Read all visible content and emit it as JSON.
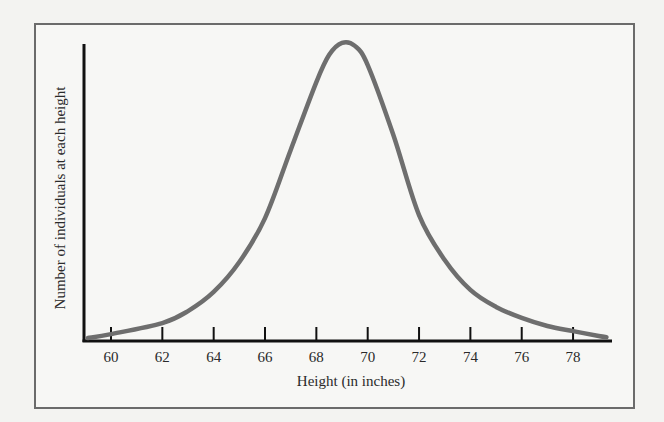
{
  "chart_data": {
    "type": "line",
    "title": "",
    "xlabel": "Height (in inches)",
    "ylabel": "Number of individuals at each height",
    "x_ticks": [
      60,
      62,
      64,
      66,
      68,
      70,
      72,
      74,
      76,
      78
    ],
    "xlim": [
      59,
      79.3
    ],
    "ylim": [
      0,
      100
    ],
    "y_ticks": [],
    "grid": false,
    "legend": null,
    "series": [
      {
        "name": "Height distribution",
        "color": "#6e6e6e",
        "x": [
          59.1,
          60,
          62,
          63,
          64,
          65,
          66,
          67,
          68,
          68.5,
          69,
          69.5,
          70,
          71,
          72,
          73,
          74,
          75,
          76,
          77,
          78,
          79,
          79.3
        ],
        "values": [
          1,
          2.3,
          6,
          10,
          16.4,
          26.4,
          41.1,
          63.9,
          86.6,
          95.7,
          99.7,
          98.7,
          92.3,
          68.9,
          42.1,
          27.1,
          17.1,
          11.4,
          7.7,
          5,
          3.3,
          1.7,
          1.3
        ]
      }
    ],
    "peak": {
      "x": 69,
      "label": "mode"
    }
  },
  "axes": {
    "x_title": "Height (in inches)",
    "y_title": "Number of individuals at each height",
    "x_tick_labels": [
      "60",
      "62",
      "64",
      "66",
      "68",
      "70",
      "72",
      "74",
      "76",
      "78"
    ]
  }
}
